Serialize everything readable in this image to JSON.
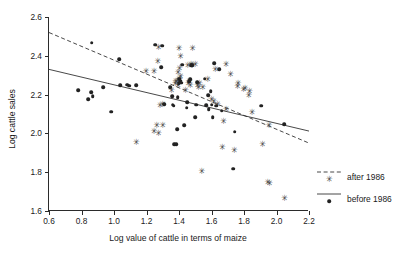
{
  "chart_data": {
    "type": "scatter",
    "title": "",
    "xlabel": "Log value of cattle in terms of maize",
    "ylabel": "Log cattle sales",
    "xlim": [
      0.6,
      2.2
    ],
    "ylim": [
      1.6,
      2.6
    ],
    "xticks": [
      "0.6",
      "0.8",
      "1.0",
      "1.2",
      "1.4",
      "1.6",
      "1.8",
      "2.0",
      "2.2"
    ],
    "yticks": [
      "1.6",
      "1.8",
      "2.0",
      "2.2",
      "2.4",
      "2.6"
    ],
    "xtick_values": [
      0.6,
      0.8,
      1.0,
      1.2,
      1.4,
      1.6,
      1.8,
      2.0,
      2.2
    ],
    "ytick_values": [
      1.6,
      1.8,
      2.0,
      2.2,
      2.4,
      2.6
    ],
    "grid": false,
    "legend_position": "right",
    "series": [
      {
        "name": "after 1986",
        "marker": "asterisk",
        "marker_glyph": "✳",
        "color": "#444444",
        "line_style": "dashed",
        "points": [
          [
            1.195,
            2.322
          ],
          [
            1.245,
            2.322
          ],
          [
            1.268,
            2.372
          ],
          [
            1.272,
            2.445
          ],
          [
            1.135,
            1.955
          ],
          [
            1.245,
            2.01
          ],
          [
            1.272,
            2.0
          ],
          [
            1.262,
            2.045
          ],
          [
            1.298,
            2.045
          ],
          [
            1.282,
            2.148
          ],
          [
            1.375,
            2.262
          ],
          [
            1.378,
            2.268
          ],
          [
            1.385,
            2.272
          ],
          [
            1.392,
            2.252
          ],
          [
            1.398,
            2.278
          ],
          [
            1.402,
            2.282
          ],
          [
            1.408,
            2.298
          ],
          [
            1.392,
            2.318
          ],
          [
            1.402,
            2.338
          ],
          [
            1.408,
            2.4
          ],
          [
            1.398,
            2.442
          ],
          [
            1.455,
            2.262
          ],
          [
            1.462,
            2.268
          ],
          [
            1.468,
            2.252
          ],
          [
            1.452,
            2.352
          ],
          [
            1.472,
            2.358
          ],
          [
            1.478,
            2.355
          ],
          [
            1.482,
            2.442
          ],
          [
            1.498,
            2.358
          ],
          [
            1.512,
            2.248
          ],
          [
            1.518,
            2.238
          ],
          [
            1.525,
            2.258
          ],
          [
            1.538,
            1.805
          ],
          [
            1.575,
            2.282
          ],
          [
            1.598,
            2.178
          ],
          [
            1.612,
            2.168
          ],
          [
            1.622,
            2.332
          ],
          [
            1.635,
            2.152
          ],
          [
            1.665,
            1.932
          ],
          [
            1.672,
            2.062
          ],
          [
            1.688,
            2.358
          ],
          [
            1.688,
            2.128
          ],
          [
            1.715,
            2.305
          ],
          [
            1.738,
            1.912
          ],
          [
            1.758,
            2.245
          ],
          [
            1.762,
            2.262
          ],
          [
            1.795,
            2.228
          ],
          [
            1.805,
            2.232
          ],
          [
            1.828,
            2.198
          ],
          [
            1.832,
            2.218
          ],
          [
            1.848,
            2.112
          ],
          [
            1.912,
            1.945
          ],
          [
            1.945,
            1.748
          ],
          [
            1.952,
            2.045
          ],
          [
            1.955,
            1.742
          ],
          [
            2.048,
            1.665
          ],
          [
            1.352,
            2.222
          ],
          [
            1.438,
            2.225
          ],
          [
            1.298,
            2.152
          ],
          [
            1.545,
            2.238
          ]
        ]
      },
      {
        "name": "before 1986",
        "marker": "dot",
        "color": "#222222",
        "line_style": "solid",
        "points": [
          [
            0.778,
            2.222
          ],
          [
            0.842,
            2.175
          ],
          [
            0.858,
            2.212
          ],
          [
            0.862,
            2.468
          ],
          [
            0.868,
            2.192
          ],
          [
            0.932,
            2.238
          ],
          [
            0.982,
            2.112
          ],
          [
            1.032,
            2.382
          ],
          [
            1.038,
            2.248
          ],
          [
            1.082,
            2.252
          ],
          [
            1.095,
            2.245
          ],
          [
            1.138,
            2.248
          ],
          [
            1.252,
            2.458
          ],
          [
            1.292,
            2.342
          ],
          [
            1.298,
            2.452
          ],
          [
            1.308,
            2.15
          ],
          [
            1.345,
            2.238
          ],
          [
            1.358,
            2.192
          ],
          [
            1.362,
            2.148
          ],
          [
            1.368,
            2.142
          ],
          [
            1.372,
            1.945
          ],
          [
            1.382,
            1.945
          ],
          [
            1.388,
            2.022
          ],
          [
            1.392,
            2.188
          ],
          [
            1.398,
            2.258
          ],
          [
            1.402,
            2.282
          ],
          [
            1.408,
            2.272
          ],
          [
            1.412,
            2.262
          ],
          [
            1.418,
            2.355
          ],
          [
            1.432,
            2.042
          ],
          [
            1.448,
            2.132
          ],
          [
            1.452,
            2.162
          ],
          [
            1.462,
            2.268
          ],
          [
            1.468,
            2.278
          ],
          [
            1.475,
            2.352
          ],
          [
            1.482,
            2.352
          ],
          [
            1.498,
            2.085
          ],
          [
            1.505,
            2.148
          ],
          [
            1.512,
            2.265
          ],
          [
            1.558,
            2.282
          ],
          [
            1.568,
            2.145
          ],
          [
            1.578,
            2.198
          ],
          [
            1.582,
            2.125
          ],
          [
            1.602,
            2.148
          ],
          [
            1.608,
            2.085
          ],
          [
            1.618,
            2.362
          ],
          [
            1.628,
            2.142
          ],
          [
            1.648,
            2.332
          ],
          [
            1.662,
            2.118
          ],
          [
            1.732,
            1.818
          ],
          [
            1.742,
            2.008
          ],
          [
            1.905,
            2.142
          ],
          [
            2.048,
            2.048
          ],
          [
            1.595,
            2.218
          ]
        ]
      }
    ],
    "trend_lines": [
      {
        "name": "after 1986",
        "style": "dashed",
        "x": [
          0.6,
          2.2
        ],
        "y": [
          2.52,
          1.95
        ]
      },
      {
        "name": "before 1986",
        "style": "solid",
        "x": [
          0.6,
          2.2
        ],
        "y": [
          2.33,
          2.012
        ]
      }
    ]
  },
  "legend": {
    "items": [
      {
        "label": "after 1986",
        "style": "dashed",
        "marker": "✳"
      },
      {
        "label": "before 1986",
        "style": "solid",
        "marker": "●"
      }
    ]
  }
}
